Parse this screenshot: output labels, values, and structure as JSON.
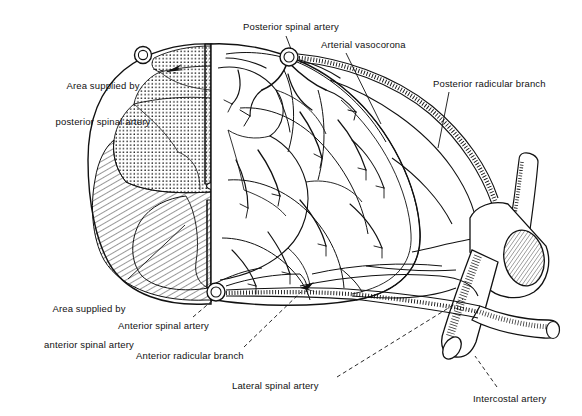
{
  "figure": {
    "type": "anatomical-line-diagram",
    "width": 582,
    "height": 416,
    "background_color": "#ffffff",
    "ink_color": "#111111"
  },
  "labels": [
    {
      "key": "posterior_spinal_artery",
      "text": "Posterior spinal artery",
      "lines": [
        "Posterior spinal artery"
      ],
      "x": 243,
      "y": 21,
      "align": "left",
      "leader": "solid",
      "leader_from": [
        286,
        36
      ],
      "leader_to": [
        290,
        50
      ]
    },
    {
      "key": "arterial_vasocorona",
      "text": "Arterial vasocorona",
      "lines": [
        "Arterial vasocorona"
      ],
      "x": 321,
      "y": 39,
      "align": "left",
      "leader": "solid",
      "leader_from": [
        346,
        53
      ],
      "leader_to": [
        380,
        123
      ]
    },
    {
      "key": "posterior_radicular_branch",
      "text": "Posterior radicular branch",
      "lines": [
        "Posterior radicular branch"
      ],
      "x": 433,
      "y": 78,
      "align": "left",
      "leader": "solid",
      "leader_from": [
        449,
        92
      ],
      "leader_to": [
        438,
        148
      ]
    },
    {
      "key": "area_supplied_posterior",
      "text": "Area supplied by posterior spinal artery",
      "lines": [
        "Area supplied by",
        "posterior spinal artery"
      ],
      "x": 45,
      "y": 56,
      "align": "left",
      "leader": "dashed",
      "leader_from": [
        153,
        70
      ],
      "leader_to": [
        175,
        73
      ]
    },
    {
      "key": "area_supplied_anterior",
      "text": "Area supplied by anterior spinal artery",
      "lines": [
        "Area supplied by",
        "anterior spinal artery"
      ],
      "x": 34,
      "y": 279,
      "align": "left",
      "leader": "solid",
      "leader_from": [
        128,
        280
      ],
      "leader_to": [
        184,
        226
      ]
    },
    {
      "key": "anterior_spinal_artery",
      "text": "Anterior spinal artery",
      "lines": [
        "Anterior spinal artery"
      ],
      "x": 118,
      "y": 320,
      "align": "left",
      "leader": "dashed",
      "leader_from": [
        193,
        318
      ],
      "leader_to": [
        214,
        299
      ]
    },
    {
      "key": "anterior_radicular_branch",
      "text": "Anterior radicular branch",
      "lines": [
        "Anterior radicular branch"
      ],
      "x": 136,
      "y": 350,
      "align": "left",
      "leader": "dashed",
      "leader_from": [
        243,
        348
      ],
      "leader_to": [
        300,
        292
      ]
    },
    {
      "key": "lateral_spinal_artery",
      "text": "Lateral spinal artery",
      "lines": [
        "Lateral spinal artery"
      ],
      "x": 232,
      "y": 380,
      "align": "left",
      "leader": "dashed",
      "leader_from": [
        336,
        378
      ],
      "leader_to": [
        462,
        298
      ]
    },
    {
      "key": "intercostal_artery",
      "text": "Intercostal artery",
      "lines": [
        "Intercostal artery"
      ],
      "x": 473,
      "y": 393,
      "align": "left",
      "leader": "dashed",
      "leader_from": [
        497,
        388
      ],
      "leader_to": [
        474,
        357
      ]
    }
  ],
  "regions": [
    {
      "key": "posterior-column-territory",
      "name": "Area supplied by posterior spinal artery",
      "fill_pattern": "stipple-dots",
      "description": "dorsal columns / posterior horns, dotted shading"
    },
    {
      "key": "anterior-territory",
      "name": "Area supplied by anterior spinal artery",
      "fill_pattern": "diagonal-hatch",
      "description": "anterior two-thirds of the cord, diagonal line shading"
    }
  ],
  "structures": [
    {
      "key": "posterior-spinal-artery-vessel",
      "name": "posterior spinal artery",
      "shape": "small-circle-cross-section"
    },
    {
      "key": "posterior-spinal-artery-cut-end",
      "name": "posterior spinal artery cut end",
      "shape": "small-circle-cross-section"
    },
    {
      "key": "anterior-spinal-artery-vessel",
      "name": "anterior spinal artery",
      "shape": "small-circle-cross-section"
    },
    {
      "key": "arterial-vasocorona-net",
      "name": "arterial vasocorona",
      "shape": "pial-vessel-network"
    },
    {
      "key": "posterior-radicular-branch-vessel",
      "name": "posterior radicular branch",
      "shape": "stippled-tube"
    },
    {
      "key": "anterior-radicular-branch-vessel",
      "name": "anterior radicular branch",
      "shape": "stippled-tube"
    },
    {
      "key": "lateral-spinal-artery-vessel",
      "name": "lateral spinal artery",
      "shape": "stippled-tube"
    },
    {
      "key": "intercostal-artery-trunk",
      "name": "intercostal artery",
      "shape": "cut-tube-with-hatched-lumen"
    },
    {
      "key": "spinal-cord-outline",
      "name": "spinal cord transverse section",
      "shape": "oval-outline"
    },
    {
      "key": "grey-matter-butterfly",
      "name": "grey matter",
      "shape": "butterfly-outline"
    },
    {
      "key": "central-canal",
      "name": "central canal",
      "shape": "small-oval"
    },
    {
      "key": "posterior-median-septum",
      "name": "posterior median septum",
      "shape": "vertical-stippled-band"
    },
    {
      "key": "anterior-median-fissure",
      "name": "anterior median fissure",
      "shape": "vertical-stippled-band"
    }
  ]
}
